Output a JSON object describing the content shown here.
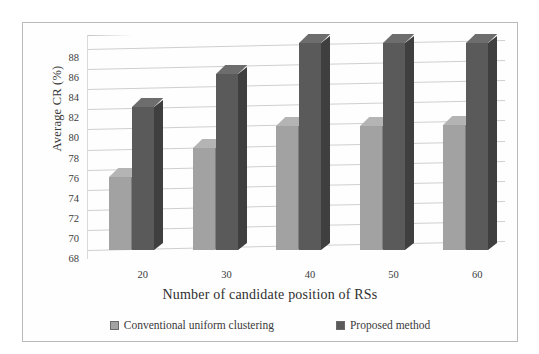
{
  "chart_data": {
    "type": "bar",
    "title": "",
    "xlabel": "Number of candidate position of RSs",
    "ylabel": "Average CR (%)",
    "categories": [
      "20",
      "30",
      "40",
      "50",
      "60"
    ],
    "ylim": [
      68,
      89
    ],
    "yticks": [
      68,
      70,
      72,
      74,
      76,
      78,
      80,
      82,
      84,
      86,
      88
    ],
    "grid": true,
    "legend_position": "bottom",
    "style": "3d-clustered-column",
    "series": [
      {
        "name": "Conventional uniform clustering",
        "color": "#a2a2a2",
        "values": [
          75.3,
          78.2,
          80.3,
          80.3,
          80.4
        ]
      },
      {
        "name": "Proposed method",
        "color": "#5a5a5a",
        "values": [
          82.2,
          85.5,
          88.6,
          88.6,
          88.6
        ]
      }
    ]
  },
  "legend": {
    "items": [
      {
        "label": "Conventional uniform clustering",
        "swatch": "light-gray-square-icon"
      },
      {
        "label": "Proposed method",
        "swatch": "dark-gray-square-icon"
      }
    ]
  }
}
